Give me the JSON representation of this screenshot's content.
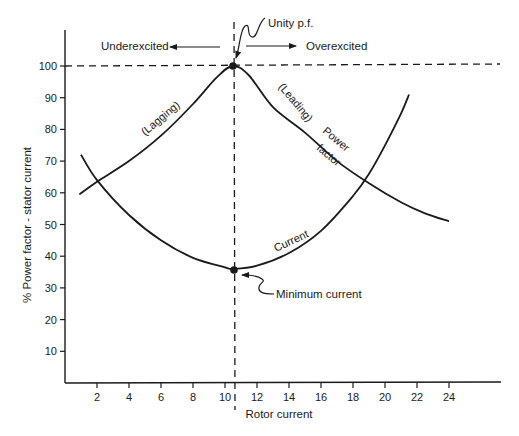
{
  "chart_data": {
    "type": "line",
    "title": "",
    "xlabel": "Rotor current",
    "ylabel": "% Power factor - stator current",
    "xlim": [
      0,
      26
    ],
    "ylim": [
      0,
      110
    ],
    "xticks": [
      2,
      4,
      6,
      8,
      10,
      12,
      14,
      16,
      18,
      20,
      22,
      24
    ],
    "yticks": [
      10,
      20,
      30,
      40,
      50,
      60,
      70,
      80,
      90,
      100
    ],
    "grid": false,
    "legend": "none",
    "series": [
      {
        "name": "Power factor",
        "x": [
          0.9,
          2,
          4,
          6,
          8,
          9.5,
          10.5,
          11.5,
          13,
          15,
          17,
          19,
          21,
          22.5,
          24
        ],
        "y": [
          59.5,
          63.5,
          70,
          78,
          88,
          96.5,
          100,
          97,
          87,
          79,
          70,
          63,
          57,
          53.5,
          51
        ]
      },
      {
        "name": "Current",
        "x": [
          1.0,
          2,
          4,
          6,
          8,
          10,
          10.5,
          12,
          14,
          16,
          18,
          19,
          20,
          21,
          21.5
        ],
        "y": [
          72,
          64,
          53,
          45,
          39.5,
          36.5,
          36,
          37,
          41,
          48,
          59,
          66,
          75,
          85,
          91
        ]
      }
    ],
    "reference_lines": [
      {
        "orientation": "horizontal",
        "value": 100,
        "style": "dashed"
      },
      {
        "orientation": "vertical",
        "value": 10.5,
        "style": "dashed"
      }
    ],
    "markers": [
      {
        "x": 10.5,
        "y": 100,
        "label": "Unity p.f."
      },
      {
        "x": 10.5,
        "y": 36,
        "label": "Minimum current"
      }
    ],
    "annotations": [
      {
        "text": "Underexcited",
        "arrow": "left"
      },
      {
        "text": "Overexcited",
        "arrow": "right"
      },
      {
        "text": "(Lagging)",
        "on": "Power factor"
      },
      {
        "text": "(Leading)",
        "on": "Power factor"
      },
      {
        "text": "Power",
        "on": "Power factor"
      },
      {
        "text": "factor",
        "on": "Power factor"
      },
      {
        "text": "Current",
        "on": "Current"
      }
    ]
  },
  "labels": {
    "xlabel": "Rotor current",
    "ylabel": "% Power factor - stator current",
    "underexcited": "Underexcited",
    "overexcited": "Overexcited",
    "unity_pf": "Unity p.f.",
    "minimum_current": "Minimum current",
    "lagging": "(Lagging)",
    "leading": "(Leading)",
    "power": "Power",
    "factor": "factor",
    "current": "Current"
  },
  "colors": {
    "ink": "#1a1a1a",
    "background": "#ffffff"
  }
}
